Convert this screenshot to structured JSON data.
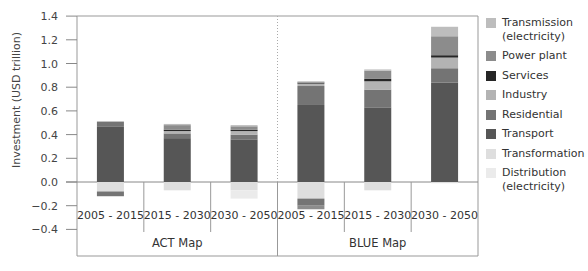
{
  "chart_data": {
    "type": "bar",
    "stacked": true,
    "title": "",
    "xlabel": "",
    "ylabel": "Investment (USD trillion)",
    "ylim": [
      -0.4,
      1.4
    ],
    "yticks": [
      "1.4",
      "1.2",
      "1.0",
      "0.8",
      "0.6",
      "0.4",
      "0.2",
      "0.0",
      "−0.2",
      "−0.4"
    ],
    "groups": [
      {
        "label": "ACT Map",
        "categories": [
          "2005 - 2015",
          "2015 - 2030",
          "2030 - 2050"
        ]
      },
      {
        "label": "BLUE Map",
        "categories": [
          "2005 - 2015",
          "2015 - 2030",
          "2030 - 2050"
        ]
      }
    ],
    "categories": [
      "2005 - 2015",
      "2015 - 2030",
      "2030 - 2050",
      "2005 - 2015",
      "2015 - 2030",
      "2030 - 2050"
    ],
    "series": [
      {
        "name": "Transport",
        "color": "#565656",
        "values": [
          0.47,
          0.37,
          0.36,
          0.65,
          0.63,
          0.84
        ]
      },
      {
        "name": "Residential",
        "color": "#747474",
        "values": [
          0.04,
          0.04,
          0.04,
          0.16,
          0.15,
          0.12
        ]
      },
      {
        "name": "Industry",
        "color": "#b3b3b3",
        "values": [
          0.0,
          0.02,
          0.03,
          0.02,
          0.07,
          0.09
        ]
      },
      {
        "name": "Services",
        "color": "#262626",
        "values": [
          0.0,
          0.01,
          0.01,
          0.01,
          0.02,
          0.02
        ]
      },
      {
        "name": "Power plant",
        "color": "#8c8c8c",
        "values": [
          0.0,
          0.04,
          0.03,
          0.0,
          0.07,
          0.16
        ]
      },
      {
        "name": "Transmission (electricity)",
        "color": "#bdbdbd",
        "values": [
          0.0,
          0.01,
          0.01,
          0.01,
          0.01,
          0.08
        ]
      },
      {
        "name": "Transformation",
        "color": "#dedede",
        "values": [
          -0.08,
          -0.07,
          -0.07,
          -0.14,
          -0.07,
          -0.01
        ]
      },
      {
        "name": "Distribution (electricity)",
        "color": "#ebebeb",
        "values": [
          0.0,
          0.0,
          -0.07,
          0.0,
          0.0,
          0.0
        ]
      },
      {
        "name": "Residential (negative)",
        "color": "#747474",
        "values": [
          -0.04,
          0.0,
          0.0,
          -0.06,
          0.0,
          0.0
        ]
      },
      {
        "name": "Transport (negative)",
        "color": "#8c8c8c",
        "values": [
          0.0,
          0.0,
          0.0,
          -0.03,
          0.0,
          0.0
        ]
      }
    ],
    "legend": {
      "position": "right",
      "entries": [
        "Transmission (electricity)",
        "Power plant",
        "Services",
        "Industry",
        "Residential",
        "Transport",
        "Transformation",
        "Distribution (electricity)"
      ]
    },
    "grid": false
  },
  "legend": [
    {
      "label": "Transmission (electricity)",
      "color": "#bdbdbd"
    },
    {
      "label": "Power plant",
      "color": "#8c8c8c"
    },
    {
      "label": "Services",
      "color": "#262626"
    },
    {
      "label": "Industry",
      "color": "#b3b3b3"
    },
    {
      "label": "Residential",
      "color": "#747474"
    },
    {
      "label": "Transport",
      "color": "#565656"
    },
    {
      "label": "Transformation",
      "color": "#dedede"
    },
    {
      "label": "Distribution (electricity)",
      "color": "#ebebeb"
    }
  ]
}
